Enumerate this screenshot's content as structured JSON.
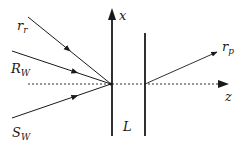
{
  "diagram": {
    "type": "optical ray diagram",
    "colors": {
      "line": "#1a1a1a",
      "background": "#ffffff"
    },
    "axes": {
      "x_label": "x",
      "z_label": "z"
    },
    "labels": {
      "r_r": {
        "main": "r",
        "sub": "r"
      },
      "R_W": {
        "main": "R",
        "sub": "W"
      },
      "S_W": {
        "main": "S",
        "sub": "W"
      },
      "r_p": {
        "main": "r",
        "sub": "p"
      },
      "L": "L"
    },
    "elements": {
      "incoming_rays": [
        "r_r",
        "R_W",
        "S_W"
      ],
      "outgoing_ray": "r_p",
      "planes": 2,
      "plane_separation_label": "L"
    }
  }
}
